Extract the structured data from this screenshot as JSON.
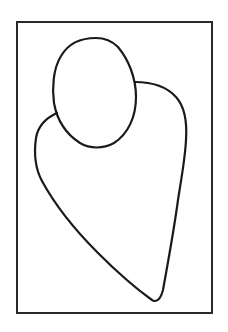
{
  "drawing": {
    "description": "Line drawing of a head and body outline inside a rectangular frame",
    "background_color": "#ffffff",
    "stroke_color": "#1a1a1a",
    "frame": {
      "x1": 16,
      "y1": 21,
      "x2": 213,
      "y2": 313
    },
    "parts": [
      {
        "name": "frame",
        "shape": "rectangle"
      },
      {
        "name": "head",
        "shape": "oval",
        "bounds": {
          "x1": 52,
          "y1": 37,
          "x2": 136,
          "y2": 148
        }
      },
      {
        "name": "body",
        "shape": "tapered-outline",
        "tip": {
          "x": 155,
          "y": 301
        }
      }
    ]
  }
}
